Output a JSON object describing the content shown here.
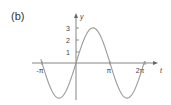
{
  "panel_label": "(b)",
  "chart_data": {
    "type": "line",
    "title": "",
    "xlabel": "t",
    "ylabel": "y",
    "function": "y = 3 sin(t)",
    "x_ticks": [
      "-π",
      "π",
      "2π"
    ],
    "x_tick_values": [
      -3.1416,
      3.1416,
      6.2832
    ],
    "y_ticks": [
      "1",
      "2",
      "3"
    ],
    "y_tick_values": [
      1,
      2,
      3
    ],
    "xlim": [
      -3.3,
      6.4
    ],
    "ylim": [
      -3.1,
      3.6
    ],
    "grid": false,
    "legend": "none",
    "series": [
      {
        "name": "y = 3 sin t",
        "x": [
          -3.1416,
          -1.5708,
          0,
          1.5708,
          3.1416,
          4.7124,
          6.2832
        ],
        "values": [
          0,
          -3,
          0,
          3,
          0,
          -3,
          0
        ]
      }
    ],
    "colors": {
      "curve": "#9a9a9a",
      "axis": "#666666"
    }
  }
}
